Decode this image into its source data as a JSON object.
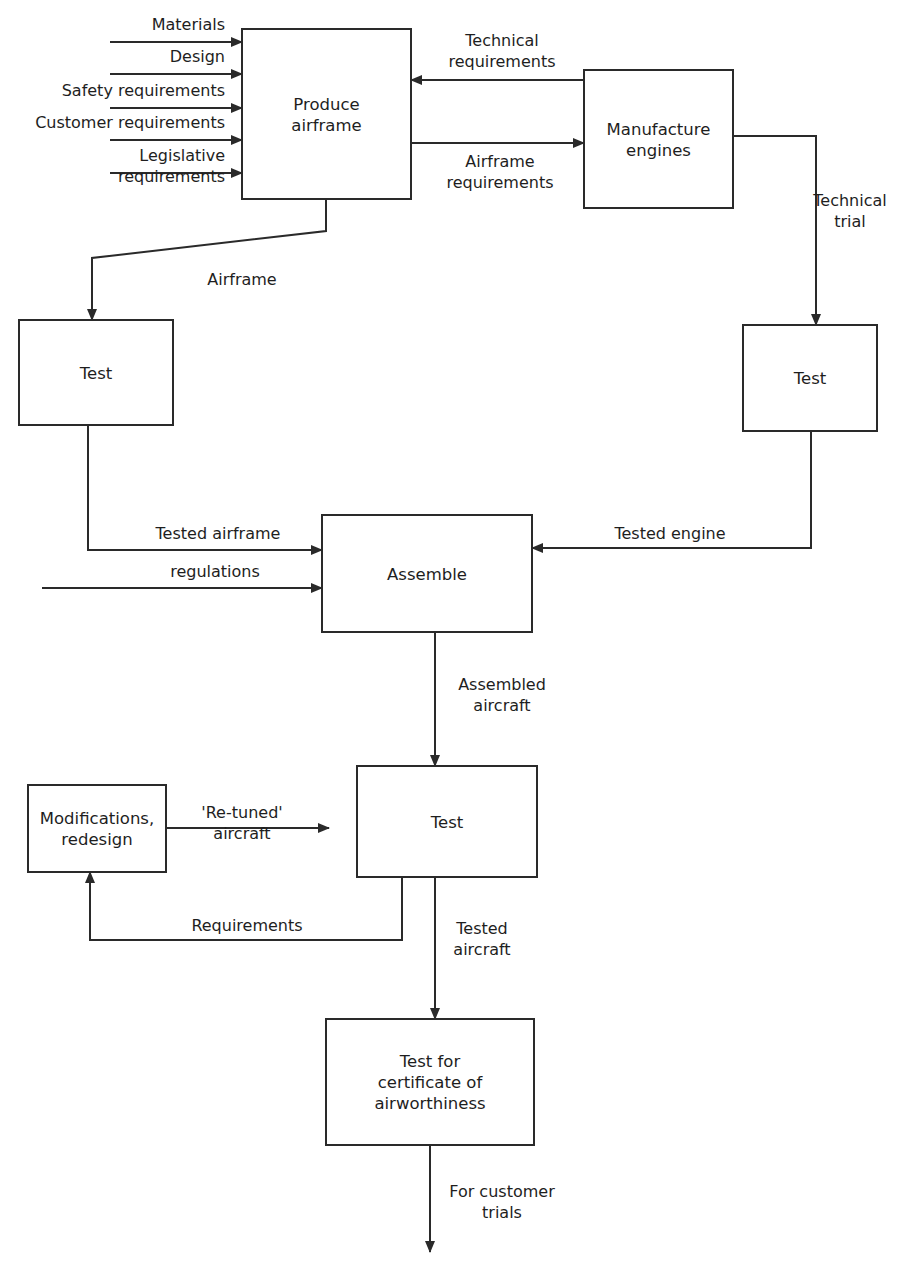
{
  "diagram": {
    "type": "flowchart",
    "colors": {
      "line": "#2a2a2a",
      "text": "#1e1e1e",
      "background": "#ffffff"
    },
    "nodes": [
      {
        "id": "produce_airframe",
        "lines": [
          "Produce",
          "airframe"
        ],
        "x": 242,
        "y": 29,
        "w": 169,
        "h": 170
      },
      {
        "id": "manufacture_engines",
        "lines": [
          "Manufacture",
          "engines"
        ],
        "x": 584,
        "y": 70,
        "w": 149,
        "h": 138
      },
      {
        "id": "test_airframe",
        "lines": [
          "Test"
        ],
        "x": 19,
        "y": 320,
        "w": 154,
        "h": 105
      },
      {
        "id": "test_engine",
        "lines": [
          "Test"
        ],
        "x": 743,
        "y": 325,
        "w": 134,
        "h": 106
      },
      {
        "id": "assemble",
        "lines": [
          "Assemble"
        ],
        "x": 322,
        "y": 515,
        "w": 210,
        "h": 117
      },
      {
        "id": "test_aircraft",
        "lines": [
          "Test"
        ],
        "x": 357,
        "y": 766,
        "w": 180,
        "h": 111
      },
      {
        "id": "modifications",
        "lines": [
          "Modifications,",
          "redesign"
        ],
        "x": 28,
        "y": 785,
        "w": 138,
        "h": 87
      },
      {
        "id": "certificate_test",
        "lines": [
          "Test for",
          "certificate of",
          "airworthiness"
        ],
        "x": 326,
        "y": 1019,
        "w": 208,
        "h": 126
      }
    ],
    "edges": [
      {
        "id": "materials",
        "points": [
          [
            110,
            42
          ],
          [
            242,
            42
          ]
        ],
        "arrow": "end",
        "label": [
          "Materials"
        ],
        "lx": 225,
        "ly": 30,
        "anchor": "end"
      },
      {
        "id": "design",
        "points": [
          [
            110,
            74
          ],
          [
            242,
            74
          ]
        ],
        "arrow": "end",
        "label": [
          "Design"
        ],
        "lx": 225,
        "ly": 62,
        "anchor": "end"
      },
      {
        "id": "safety",
        "points": [
          [
            110,
            108
          ],
          [
            242,
            108
          ]
        ],
        "arrow": "end",
        "label": [
          "Safety requirements"
        ],
        "lx": 225,
        "ly": 96,
        "anchor": "end"
      },
      {
        "id": "customer",
        "points": [
          [
            110,
            140
          ],
          [
            242,
            140
          ]
        ],
        "arrow": "end",
        "label": [
          "Customer requirements"
        ],
        "lx": 225,
        "ly": 128,
        "anchor": "end"
      },
      {
        "id": "legislative",
        "points": [
          [
            110,
            173
          ],
          [
            242,
            173
          ]
        ],
        "arrow": "end",
        "label": [
          "Legislative",
          "requirements"
        ],
        "lx": 225,
        "ly": 161,
        "anchor": "end"
      },
      {
        "id": "technical_requirements",
        "points": [
          [
            584,
            80
          ],
          [
            411,
            80
          ]
        ],
        "arrow": "end",
        "label": [
          "Technical",
          "requirements"
        ],
        "lx": 502,
        "ly": 46,
        "anchor": "middle"
      },
      {
        "id": "airframe_requirements",
        "points": [
          [
            411,
            143
          ],
          [
            584,
            143
          ]
        ],
        "arrow": "end",
        "label": [
          "Airframe",
          "requirements"
        ],
        "lx": 500,
        "ly": 167,
        "anchor": "middle"
      },
      {
        "id": "technical_trial",
        "points": [
          [
            733,
            136
          ],
          [
            816,
            136
          ],
          [
            816,
            325
          ]
        ],
        "arrow": "end",
        "label": [
          "Technical",
          "trial"
        ],
        "lx": 850,
        "ly": 206,
        "anchor": "middle"
      },
      {
        "id": "airframe",
        "points": [
          [
            326,
            199
          ],
          [
            326,
            231
          ],
          [
            92,
            258
          ],
          [
            92,
            320
          ]
        ],
        "arrow": "end",
        "label": [
          "Airframe"
        ],
        "lx": 242,
        "ly": 285,
        "anchor": "middle"
      },
      {
        "id": "tested_airframe",
        "points": [
          [
            88,
            425
          ],
          [
            88,
            550
          ],
          [
            322,
            550
          ]
        ],
        "arrow": "end",
        "label": [
          "Tested airframe"
        ],
        "lx": 218,
        "ly": 539,
        "anchor": "middle"
      },
      {
        "id": "regulations",
        "points": [
          [
            42,
            588
          ],
          [
            322,
            588
          ]
        ],
        "arrow": "end",
        "label": [
          "regulations"
        ],
        "lx": 215,
        "ly": 577,
        "anchor": "middle"
      },
      {
        "id": "tested_engine",
        "points": [
          [
            811,
            431
          ],
          [
            811,
            548
          ],
          [
            532,
            548
          ]
        ],
        "arrow": "end",
        "label": [
          "Tested engine"
        ],
        "lx": 670,
        "ly": 539,
        "anchor": "middle"
      },
      {
        "id": "assembled_aircraft",
        "points": [
          [
            435,
            632
          ],
          [
            435,
            766
          ]
        ],
        "arrow": "end",
        "label": [
          "Assembled",
          "aircraft"
        ],
        "lx": 502,
        "ly": 690,
        "anchor": "middle"
      },
      {
        "id": "retuned_aircraft",
        "points": [
          [
            166,
            828
          ],
          [
            329,
            828
          ]
        ],
        "arrow": "end",
        "label": [
          "'Re-tuned'",
          "aircraft"
        ],
        "lx": 242,
        "ly": 818,
        "anchor": "middle"
      },
      {
        "id": "requirements_feedback",
        "points": [
          [
            402,
            877
          ],
          [
            402,
            940
          ],
          [
            90,
            940
          ],
          [
            90,
            872
          ]
        ],
        "arrow": "end",
        "label": [
          "Requirements"
        ],
        "lx": 247,
        "ly": 931,
        "anchor": "middle"
      },
      {
        "id": "tested_aircraft",
        "points": [
          [
            435,
            877
          ],
          [
            435,
            1019
          ]
        ],
        "arrow": "end",
        "label": [
          "Tested",
          "aircraft"
        ],
        "lx": 482,
        "ly": 934,
        "anchor": "middle"
      },
      {
        "id": "for_customer_trials",
        "points": [
          [
            430,
            1145
          ],
          [
            430,
            1252
          ]
        ],
        "arrow": "end",
        "label": [
          "For customer",
          "trials"
        ],
        "lx": 502,
        "ly": 1197,
        "anchor": "middle"
      }
    ]
  }
}
